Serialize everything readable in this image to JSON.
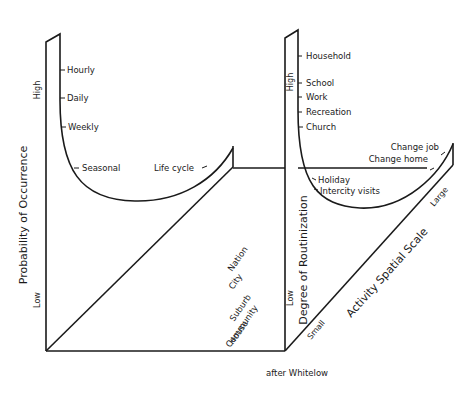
{
  "left_panel": {
    "y_axis_title": "Probability of Occurrence",
    "y_high": "High",
    "y_low": "Low",
    "curve_labels": [
      "Hourly",
      "Daily",
      "Weekly",
      "Seasonal",
      "Life cycle"
    ],
    "scale_labels": [
      "Nation",
      "City",
      "Suburb",
      "Community",
      "House"
    ]
  },
  "right_panel": {
    "y_axis_title": "Degree of Routinization",
    "y_high": "High",
    "y_low": "Low",
    "curve_labels": [
      "Household",
      "School",
      "Work",
      "Recreation",
      "Church",
      "Holiday",
      "Intercity visits",
      "Change home",
      "Change job"
    ],
    "x_axis_title": "Activity Spatial Scale",
    "x_small": "Small",
    "x_large": "Large"
  },
  "credit": "after Whitelow",
  "colors": {
    "ink": "#1a1a1a",
    "background": "#ffffff"
  }
}
